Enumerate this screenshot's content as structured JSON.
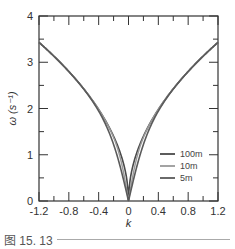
{
  "chart_data": {
    "type": "line",
    "title": "",
    "xlabel": "k",
    "ylabel": "ω (s⁻¹)",
    "xlim": [
      -1.2,
      1.2
    ],
    "ylim": [
      0,
      4
    ],
    "x_ticks": [
      "-1.2",
      "-0.8",
      "-0.4",
      "0",
      "0.4",
      "0.8",
      "1.2"
    ],
    "y_ticks": [
      "0",
      "1",
      "2",
      "3",
      "4"
    ],
    "grid": false,
    "legend_position": "lower right",
    "series": [
      {
        "name": "100m",
        "color": "#4a4a4a",
        "depth": 100,
        "x": [
          -1.2,
          -1.0,
          -0.8,
          -0.6,
          -0.4,
          -0.2,
          -0.1,
          0,
          0.1,
          0.2,
          0.4,
          0.6,
          0.8,
          1.0,
          1.2
        ],
        "values": [
          3.43,
          3.13,
          2.8,
          2.42,
          1.98,
          1.4,
          0.99,
          0,
          0.99,
          1.4,
          1.98,
          2.42,
          2.8,
          3.13,
          3.43
        ]
      },
      {
        "name": "10m",
        "color": "#999999",
        "depth": 10,
        "x": [
          -1.2,
          -1.0,
          -0.8,
          -0.6,
          -0.4,
          -0.2,
          -0.1,
          0,
          0.1,
          0.2,
          0.4,
          0.6,
          0.8,
          1.0,
          1.2
        ],
        "values": [
          3.43,
          3.13,
          2.8,
          2.42,
          1.98,
          1.37,
          0.86,
          0,
          0.86,
          1.37,
          1.98,
          2.42,
          2.8,
          3.13,
          3.43
        ]
      },
      {
        "name": "5m",
        "color": "#5a5a5a",
        "depth": 5,
        "x": [
          -1.2,
          -1.0,
          -0.8,
          -0.6,
          -0.4,
          -0.2,
          -0.1,
          0,
          0.1,
          0.2,
          0.4,
          0.6,
          0.8,
          1.0,
          1.2
        ],
        "values": [
          3.43,
          3.13,
          2.8,
          2.42,
          1.96,
          1.29,
          0.67,
          0,
          0.67,
          1.29,
          1.96,
          2.42,
          2.8,
          3.13,
          3.43
        ]
      }
    ]
  },
  "caption": {
    "label": "图 15. 13"
  }
}
